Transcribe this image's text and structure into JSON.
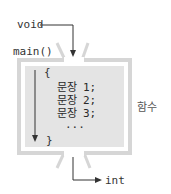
{
  "diagram": {
    "input_label": "void",
    "function_name": "main()",
    "open_brace": "{",
    "close_brace": "}",
    "statements": [
      {
        "keyword": "문장",
        "suffix": "1;"
      },
      {
        "keyword": "문장",
        "suffix": "2;"
      },
      {
        "keyword": "문장",
        "suffix": "3;"
      }
    ],
    "ellipsis": "...",
    "side_label": "함수",
    "output_label": "int"
  },
  "colors": {
    "frame": "#d6d6d6",
    "inner_fill": "#e4e4e4",
    "arrow": "#333333",
    "text": "#333333"
  }
}
